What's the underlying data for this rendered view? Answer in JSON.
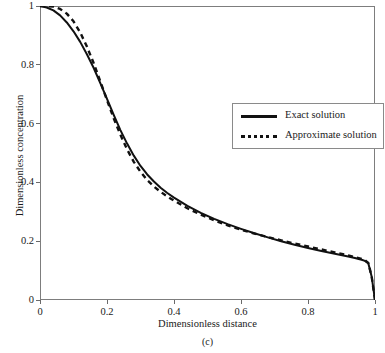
{
  "chart_data": {
    "type": "line",
    "title": "",
    "xlabel": "Dimensionless distance",
    "ylabel": "Dimensionless concentration",
    "caption": "(c)",
    "xlim": [
      0,
      1
    ],
    "ylim": [
      0,
      1
    ],
    "grid": false,
    "legend_position": "center-right",
    "xticks": [
      "0",
      "0.2",
      "0.4",
      "0.6",
      "0.8",
      "1"
    ],
    "xtick_values": [
      0,
      0.2,
      0.4,
      0.6,
      0.8,
      1
    ],
    "yticks": [
      "0",
      "0.2",
      "0.4",
      "0.6",
      "0.8",
      "1"
    ],
    "ytick_values": [
      0,
      0.2,
      0.4,
      0.6,
      0.8,
      1
    ],
    "series": [
      {
        "name": "Exact solution",
        "style": "solid",
        "color": "#111111",
        "x": [
          0.0,
          0.02,
          0.04,
          0.06,
          0.08,
          0.1,
          0.12,
          0.14,
          0.16,
          0.18,
          0.2,
          0.22,
          0.24,
          0.26,
          0.28,
          0.3,
          0.32,
          0.34,
          0.36,
          0.38,
          0.4,
          0.44,
          0.48,
          0.52,
          0.56,
          0.6,
          0.64,
          0.68,
          0.72,
          0.76,
          0.8,
          0.84,
          0.88,
          0.92,
          0.94,
          0.96,
          0.97,
          0.98,
          0.99,
          1.0
        ],
        "y": [
          1.0,
          0.995,
          0.985,
          0.968,
          0.944,
          0.914,
          0.878,
          0.836,
          0.79,
          0.738,
          0.684,
          0.63,
          0.578,
          0.532,
          0.491,
          0.456,
          0.427,
          0.403,
          0.382,
          0.364,
          0.348,
          0.32,
          0.296,
          0.276,
          0.258,
          0.242,
          0.227,
          0.213,
          0.2,
          0.188,
          0.177,
          0.167,
          0.157,
          0.148,
          0.143,
          0.137,
          0.133,
          0.125,
          0.08,
          0.0
        ]
      },
      {
        "name": "Approximate solution",
        "style": "dashed",
        "color": "#111111",
        "x": [
          0.0,
          0.02,
          0.04,
          0.06,
          0.08,
          0.1,
          0.12,
          0.14,
          0.16,
          0.18,
          0.2,
          0.22,
          0.24,
          0.26,
          0.28,
          0.3,
          0.32,
          0.34,
          0.36,
          0.38,
          0.4,
          0.44,
          0.48,
          0.52,
          0.56,
          0.6,
          0.64,
          0.68,
          0.72,
          0.76,
          0.8,
          0.84,
          0.88,
          0.92,
          0.94,
          0.96,
          0.97,
          0.98,
          0.99,
          1.0
        ],
        "y": [
          1.0,
          1.0,
          0.998,
          0.99,
          0.974,
          0.948,
          0.91,
          0.862,
          0.806,
          0.744,
          0.68,
          0.618,
          0.562,
          0.512,
          0.47,
          0.436,
          0.408,
          0.386,
          0.368,
          0.352,
          0.338,
          0.312,
          0.29,
          0.271,
          0.254,
          0.239,
          0.226,
          0.214,
          0.203,
          0.192,
          0.182,
          0.172,
          0.162,
          0.152,
          0.146,
          0.14,
          0.135,
          0.126,
          0.08,
          0.0
        ]
      }
    ]
  },
  "legend": {
    "entries": [
      {
        "label": "Exact solution",
        "style": "solid"
      },
      {
        "label": "Approximate solution",
        "style": "dashed"
      }
    ]
  }
}
